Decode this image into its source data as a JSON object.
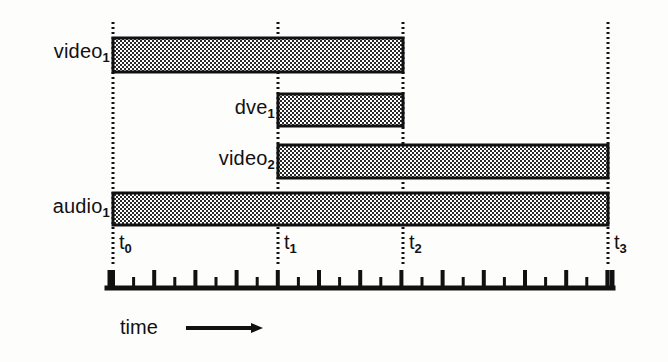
{
  "figure": {
    "kind": "timeline-gantt",
    "background_color": "#fdfdfc",
    "ink_color": "#111111",
    "bar_fill_color": "#9a9a9a",
    "bar_border_color": "#111111"
  },
  "axis": {
    "caption": "time",
    "arrow_icon": "right-arrow-icon",
    "baseline": {
      "x_start": 108,
      "x_end": 612,
      "y": 288
    },
    "tick_spacing_px": 20.6,
    "major_tick_height": 16,
    "minor_tick_height": 9,
    "tick_count": 25
  },
  "time_markers": [
    {
      "id": "t0",
      "base": "t",
      "sub": "0",
      "x": 113,
      "label": "t0"
    },
    {
      "id": "t1",
      "base": "t",
      "sub": "1",
      "x": 278,
      "label": "t1"
    },
    {
      "id": "t2",
      "base": "t",
      "sub": "2",
      "x": 403,
      "label": "t2"
    },
    {
      "id": "t3",
      "base": "t",
      "sub": "3",
      "x": 608,
      "label": "t3"
    }
  ],
  "tracks": [
    {
      "id": "video1",
      "base": "video",
      "sub": "1",
      "label": "video1",
      "label_x_right": 110,
      "label_y": 48,
      "bar": {
        "x": 113,
        "y": 38,
        "width": 290,
        "height": 34
      },
      "start_marker": "t0",
      "end_marker": "t2"
    },
    {
      "id": "dve1",
      "base": "dve",
      "sub": "1",
      "label": "dve1",
      "label_x_right": 275,
      "label_y": 103,
      "bar": {
        "x": 278,
        "y": 94,
        "width": 125,
        "height": 32
      },
      "start_marker": "t1",
      "end_marker": "t2"
    },
    {
      "id": "video2",
      "base": "video",
      "sub": "2",
      "label": "video2",
      "label_x_right": 275,
      "label_y": 154,
      "bar": {
        "x": 278,
        "y": 145,
        "width": 330,
        "height": 33
      },
      "start_marker": "t1",
      "end_marker": "t3"
    },
    {
      "id": "audio1",
      "base": "audio",
      "sub": "1",
      "label": "audio1",
      "label_x_right": 110,
      "label_y": 200,
      "bar": {
        "x": 113,
        "y": 193,
        "width": 495,
        "height": 32
      },
      "start_marker": "t0",
      "end_marker": "t3"
    }
  ],
  "guides": {
    "dotted_line_top": 22,
    "dotted_line_bottom": 265,
    "dash_pattern": "2 3"
  },
  "caption": {
    "text": "time",
    "x": 120,
    "y": 326,
    "arrow": {
      "x_start": 185,
      "x_end": 265,
      "y": 320
    }
  }
}
